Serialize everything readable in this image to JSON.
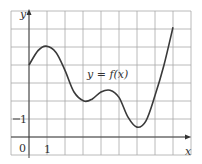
{
  "chart_data": {
    "type": "line",
    "title": "",
    "xlabel": "x",
    "ylabel": "y",
    "curve_label": "y = f(x)",
    "origin_label": "0",
    "x_tick_labels": [
      {
        "value": 1,
        "label": "1"
      }
    ],
    "y_tick_labels": [
      {
        "value": 1,
        "label": "1"
      }
    ],
    "xlim": [
      -1,
      9
    ],
    "ylim": [
      -1,
      7
    ],
    "grid": true,
    "grid_step": 1,
    "legend": null,
    "series": [
      {
        "name": "f(x)",
        "x": [
          0,
          0.5,
          0.95,
          1.5,
          2.0,
          2.5,
          3.05,
          3.5,
          4.0,
          4.5,
          5.0,
          5.5,
          6.0,
          6.5,
          7.0,
          7.5,
          8.0
        ],
        "y": [
          4.0,
          4.8,
          5.05,
          4.7,
          3.7,
          2.5,
          2.0,
          2.1,
          2.5,
          2.6,
          2.2,
          1.1,
          0.55,
          0.9,
          2.3,
          4.0,
          6.1
        ]
      }
    ],
    "annotations": [
      {
        "text": "y = f(x)",
        "x": 4.3,
        "y": 3.5
      }
    ]
  },
  "labels": {
    "x_axis": "x",
    "y_axis": "y",
    "curve": "y = f(x)",
    "origin": "0",
    "x_one": "1",
    "y_one": "1"
  }
}
